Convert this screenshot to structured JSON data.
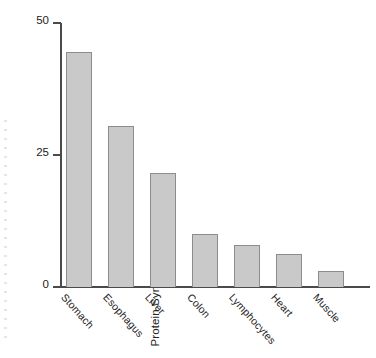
{
  "chart_data": {
    "type": "bar",
    "title": "",
    "xlabel": "",
    "ylabel": "Protein Synthesis (%/day)",
    "categories": [
      "Stomach",
      "Esophagus",
      "Liver",
      "Colon",
      "Lymphocytes",
      "Heart",
      "Muscle"
    ],
    "values": [
      44.5,
      30.5,
      21.5,
      10,
      8,
      6.3,
      3
    ],
    "ylim": [
      0,
      50
    ],
    "yticks": [
      0,
      25,
      50
    ],
    "ytick_labels": [
      "0",
      "25",
      "50"
    ],
    "grid": false,
    "legend": false,
    "bar_fill_color": "#c9c9c9",
    "bar_edge_color": "#8c8c8c",
    "axis_color": "#4a4a4a"
  },
  "axes": {
    "y_title": "Protein Synthesis (%/day)",
    "ticks": [
      {
        "label": "50",
        "value": 50
      },
      {
        "label": "25",
        "value": 25
      },
      {
        "label": "0",
        "value": 0
      }
    ]
  },
  "bars": [
    {
      "label": "Stomach",
      "value": 44.5
    },
    {
      "label": "Esophagus",
      "value": 30.5
    },
    {
      "label": "Liver",
      "value": 21.5
    },
    {
      "label": "Colon",
      "value": 10
    },
    {
      "label": "Lymphocytes",
      "value": 8
    },
    {
      "label": "Heart",
      "value": 6.3
    },
    {
      "label": "Muscle",
      "value": 3
    }
  ]
}
